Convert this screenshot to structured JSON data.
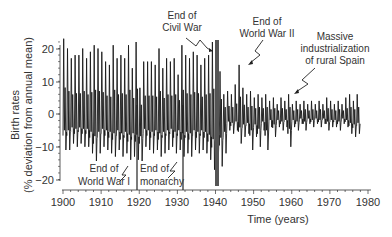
{
  "chart_data": {
    "type": "line",
    "title": "",
    "xlabel": "Time (years)",
    "ylabel_line1": "Birth rates",
    "ylabel_line2": "(% deviation from annual mean)",
    "xlim": [
      1900,
      1980
    ],
    "ylim": [
      -20,
      25
    ],
    "x_ticks": [
      1900,
      1910,
      1920,
      1930,
      1940,
      1950,
      1960,
      1970,
      1980
    ],
    "y_ticks": [
      -20,
      -10,
      0,
      10,
      20
    ],
    "grid": false,
    "legend": null,
    "series_description": "Monthly birth rate deviation, oscillating yearly; annual peak (max) and trough (min) values listed",
    "years": [
      1900,
      1901,
      1902,
      1903,
      1904,
      1905,
      1906,
      1907,
      1908,
      1909,
      1910,
      1911,
      1912,
      1913,
      1914,
      1915,
      1916,
      1917,
      1918,
      1919,
      1920,
      1921,
      1922,
      1923,
      1924,
      1925,
      1926,
      1927,
      1928,
      1929,
      1930,
      1931,
      1932,
      1933,
      1934,
      1935,
      1936,
      1937,
      1938,
      1939,
      1940,
      1941,
      1942,
      1943,
      1944,
      1945,
      1946,
      1947,
      1948,
      1949,
      1950,
      1951,
      1952,
      1953,
      1954,
      1955,
      1956,
      1957,
      1958,
      1959,
      1960,
      1961,
      1962,
      1963,
      1964,
      1965,
      1966,
      1967,
      1968,
      1969,
      1970,
      1971,
      1972,
      1973,
      1974,
      1975,
      1976,
      1977
    ],
    "annual_max": [
      23,
      20,
      17,
      18,
      18,
      20,
      17,
      19,
      21,
      20,
      19,
      16,
      15,
      21,
      17,
      18,
      17,
      21,
      14,
      22,
      8,
      16,
      16,
      16,
      15,
      20,
      14,
      17,
      16,
      17,
      12,
      21,
      18,
      17,
      19,
      18,
      15,
      17,
      18,
      22,
      17,
      13,
      6,
      7,
      6,
      9,
      15,
      8,
      6,
      7,
      5,
      6,
      5,
      6,
      4,
      5,
      3,
      5,
      4,
      6,
      3,
      4,
      3,
      4,
      3,
      4,
      3,
      4,
      3,
      5,
      4,
      3,
      4,
      3,
      5,
      6,
      4,
      6
    ],
    "annual_min": [
      -11,
      -11,
      -9,
      -10,
      -9,
      -10,
      -10,
      -12,
      -15,
      -12,
      -10,
      -11,
      -12,
      -13,
      -11,
      -13,
      -12,
      -14,
      -13,
      -14,
      -15,
      -10,
      -11,
      -12,
      -11,
      -13,
      -12,
      -11,
      -10,
      -12,
      -11,
      -13,
      -12,
      -13,
      -11,
      -12,
      -11,
      -12,
      -14,
      -17,
      -13,
      -16,
      -12,
      -5,
      -6,
      -5,
      -9,
      -7,
      -6,
      -11,
      -7,
      -10,
      -5,
      -11,
      -4,
      -7,
      -4,
      -5,
      -4,
      -10,
      -4,
      -5,
      -3,
      -5,
      -3,
      -4,
      -3,
      -4,
      -3,
      -5,
      -4,
      -4,
      -5,
      -3,
      -4,
      -6,
      -7,
      -6
    ],
    "annotations": [
      {
        "id": "ww1",
        "line1": "End of",
        "line2": "World War I",
        "year": 1919.5,
        "marker": "vertical-line"
      },
      {
        "id": "monarchy",
        "line1": "End of",
        "line2": "monarchy",
        "year": 1931.5,
        "marker": "vertical-line"
      },
      {
        "id": "civil-war",
        "line1": "End of",
        "line2": "Civil War",
        "year": 1939.3,
        "marker": "thick-bar"
      },
      {
        "id": "ww2",
        "line1": "End of",
        "line2": "World War II",
        "year": 1945.5,
        "marker": "arrow"
      },
      {
        "id": "industrialization",
        "line1": "Massive",
        "line2": "industrialization",
        "line3": "of rural Spain",
        "year": 1960,
        "marker": "arrow"
      }
    ]
  },
  "labels": {
    "xlabel": "Time (years)",
    "ylabel_line1": "Birth rates",
    "ylabel_line2": "(% deviation from annual mean)",
    "x_tick_labels": [
      "1900",
      "1910",
      "1920",
      "1930",
      "1940",
      "1950",
      "1960",
      "1970",
      "1980"
    ],
    "y_tick_labels": [
      "20",
      "10",
      "0",
      "−10",
      "−20"
    ],
    "ann_ww1_1": "End of",
    "ann_ww1_2": "World War I",
    "ann_mon_1": "End of",
    "ann_mon_2": "monarchy",
    "ann_cw_1": "End of",
    "ann_cw_2": "Civil War",
    "ann_ww2_1": "End of",
    "ann_ww2_2": "World War II",
    "ann_ind_1": "Massive",
    "ann_ind_2": "industrialization",
    "ann_ind_3": "of rural Spain"
  },
  "colors": {
    "series": "#1a1a1a",
    "axis": "#333333",
    "bar": "#555555"
  }
}
